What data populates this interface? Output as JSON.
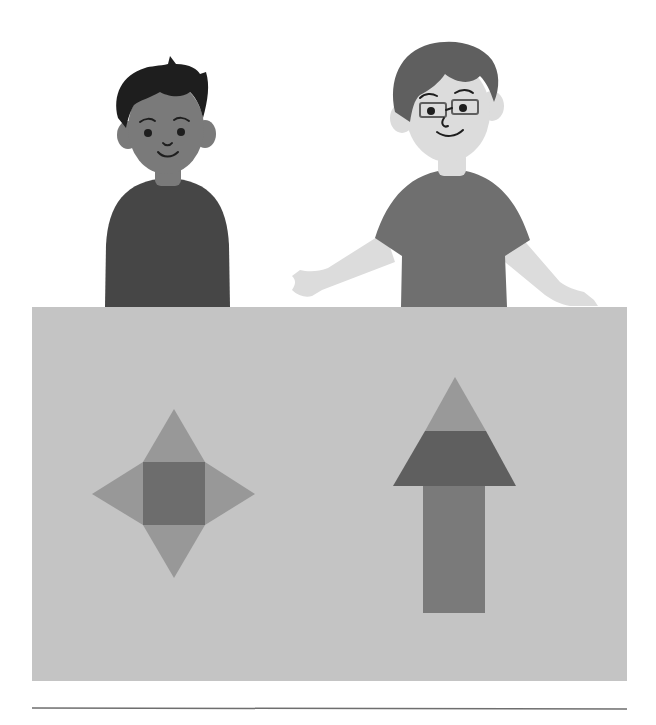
{
  "scene": {
    "title": "Two children standing behind a board showing two shape nets",
    "characters": [
      {
        "name": "boy-left",
        "description": "boy with dark hair and dark shirt"
      },
      {
        "name": "boy-right",
        "description": "boy with glasses, arms spread out"
      }
    ],
    "board_shapes": [
      {
        "name": "square-pyramid-net",
        "description": "square with four triangles (star shape)"
      },
      {
        "name": "arrow-shape",
        "description": "upward arrow made of triangle, trapezoid, and rectangle"
      }
    ]
  },
  "colors": {
    "background": "#ffffff",
    "board": "#c4c4c4",
    "separator": "#6e6e6e",
    "dark_shirt": "#464646",
    "medium_shirt": "#6f6f6f",
    "dark_skin": "#7a7a7a",
    "light_skin": "#dcdcdc",
    "dark_hair": "#1e1e1e",
    "medium_hair": "#5f5f5f",
    "net_triangle": "#989898",
    "net_square": "#6d6d6d",
    "arrow_top": "#999999",
    "arrow_mid": "#5f5f5f",
    "arrow_stem": "#7a7a7a"
  }
}
